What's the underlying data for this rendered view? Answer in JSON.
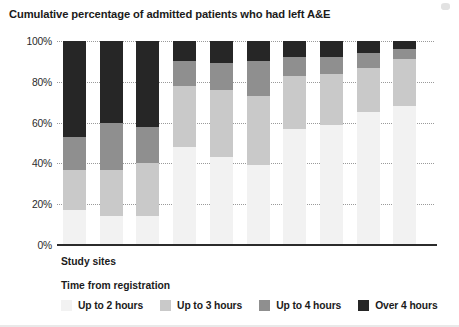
{
  "chart_data": {
    "type": "bar",
    "stacked": true,
    "title": "Cumulative percentage of admitted patients who had left A&E",
    "xlabel": "Study sites",
    "ylabel": "",
    "ylim": [
      0,
      100
    ],
    "y_ticks": [
      "0%",
      "20%",
      "40%",
      "60%",
      "80%",
      "100%"
    ],
    "y_tick_values": [
      0,
      20,
      40,
      60,
      80,
      100
    ],
    "grid": true,
    "legend_title": "Time from registration",
    "legend_position": "bottom",
    "categories": [
      "1",
      "2",
      "3",
      "4",
      "5",
      "6",
      "7",
      "8",
      "9",
      "10"
    ],
    "series": [
      {
        "name": "Up to 2 hours",
        "color": "#f2f2f2",
        "values": [
          17,
          14,
          14,
          48,
          43,
          39,
          57,
          59,
          65,
          68
        ]
      },
      {
        "name": "Up to 3 hours",
        "color": "#c9c9c9",
        "values": [
          20,
          23,
          26,
          30,
          33,
          34,
          26,
          25,
          22,
          23
        ]
      },
      {
        "name": "Up to 4 hours",
        "color": "#8f8f8f",
        "values": [
          16,
          23,
          18,
          12,
          13,
          17,
          9,
          8,
          7,
          5
        ]
      },
      {
        "name": "Over 4 hours",
        "color": "#262626",
        "values": [
          47,
          40,
          42,
          10,
          11,
          10,
          8,
          8,
          6,
          4
        ]
      }
    ],
    "cumulative_tops": [
      [
        17,
        37,
        53,
        100
      ],
      [
        14,
        37,
        60,
        100
      ],
      [
        14,
        40,
        58,
        100
      ],
      [
        48,
        78,
        90,
        100
      ],
      [
        43,
        76,
        89,
        100
      ],
      [
        39,
        73,
        90,
        100
      ],
      [
        57,
        83,
        92,
        100
      ],
      [
        59,
        84,
        92,
        100
      ],
      [
        65,
        87,
        94,
        100
      ],
      [
        68,
        91,
        96,
        100
      ]
    ]
  }
}
